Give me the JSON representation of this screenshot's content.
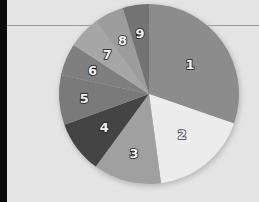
{
  "chart_data": {
    "type": "pie",
    "title": "",
    "legend": "none",
    "start_angle_deg": 0,
    "direction": "clockwise",
    "categories": [
      "1",
      "2",
      "3",
      "4",
      "5",
      "6",
      "7",
      "8",
      "9"
    ],
    "values": [
      30.3,
      17.5,
      12.2,
      9.4,
      8.9,
      5.8,
      5.8,
      5.3,
      4.7
    ],
    "colors": [
      "#8c8c8c",
      "#ececec",
      "#a0a0a0",
      "#444444",
      "#7a7a7a",
      "#7f7f7f",
      "#a6a6a6",
      "#9c9c9c",
      "#737373"
    ],
    "slice_labels": [
      "1",
      "2",
      "3",
      "4",
      "5",
      "6",
      "7",
      "8",
      "9"
    ]
  },
  "colors": {
    "background": "#e4e4e4",
    "left_bar": "#0a0a0a",
    "rule": "#9a9a9a"
  }
}
